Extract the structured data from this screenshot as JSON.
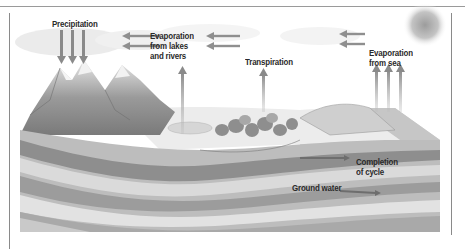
{
  "diagram": {
    "labels": {
      "precipitation": "Precipitation",
      "evaporation_lakes": "Evaporation\nfrom lakes\nand rivers",
      "transpiration": "Transpiration",
      "evaporation_sea": "Evaporation\nfrom sea",
      "completion": "Completion\nof cycle",
      "ground_water": "Ground water"
    },
    "colors": {
      "arrow": "#8f8f8f",
      "text": "#2a2a2a",
      "sky": "#f4f4f4",
      "sea": "#d2d2d2",
      "rock_dark": "#8a8a8a",
      "rock_light": "#d8d8d8"
    }
  }
}
